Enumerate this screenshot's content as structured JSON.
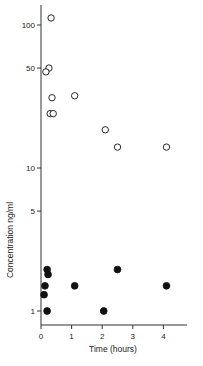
{
  "chart_data": {
    "type": "scatter",
    "title": "",
    "xlabel": "Time (hours)",
    "ylabel": "Concentration ng/ml",
    "yscale": "log",
    "xlim": [
      0,
      4.6
    ],
    "ylim": [
      0.8,
      130
    ],
    "x_ticks": [
      0,
      1,
      2,
      3,
      4
    ],
    "x_tick_labels": [
      "0",
      "1",
      "2",
      "3",
      "4"
    ],
    "y_ticks": [
      1,
      5,
      10,
      50,
      100
    ],
    "y_tick_labels": [
      "1",
      "5",
      "10",
      "50",
      "100"
    ],
    "grid": false,
    "legend": null,
    "series": [
      {
        "name": "open circles",
        "marker": "open-circle",
        "points": [
          {
            "x": 0.33,
            "y": 112
          },
          {
            "x": 0.26,
            "y": 50
          },
          {
            "x": 0.16,
            "y": 47
          },
          {
            "x": 0.36,
            "y": 31
          },
          {
            "x": 0.3,
            "y": 24
          },
          {
            "x": 0.4,
            "y": 24
          },
          {
            "x": 1.1,
            "y": 32
          },
          {
            "x": 2.1,
            "y": 18.5
          },
          {
            "x": 2.5,
            "y": 14
          },
          {
            "x": 4.1,
            "y": 14
          }
        ]
      },
      {
        "name": "filled circles",
        "marker": "filled-circle",
        "points": [
          {
            "x": 0.2,
            "y": 1.95
          },
          {
            "x": 0.23,
            "y": 1.8
          },
          {
            "x": 0.13,
            "y": 1.5
          },
          {
            "x": 0.1,
            "y": 1.3
          },
          {
            "x": 0.2,
            "y": 1.0
          },
          {
            "x": 1.1,
            "y": 1.5
          },
          {
            "x": 2.05,
            "y": 1.0
          },
          {
            "x": 2.5,
            "y": 1.95
          },
          {
            "x": 4.1,
            "y": 1.5
          }
        ]
      }
    ]
  },
  "colors": {
    "axis": "#333333",
    "marker": "#111111",
    "background": "#ffffff"
  }
}
